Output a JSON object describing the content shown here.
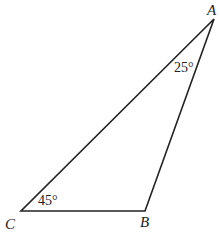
{
  "figure": {
    "type": "triangle",
    "vertices": [
      {
        "label": "A",
        "x": 214,
        "y": 19
      },
      {
        "label": "B",
        "x": 145,
        "y": 211
      },
      {
        "label": "C",
        "x": 21,
        "y": 211
      }
    ],
    "angles": [
      {
        "vertex": "A",
        "label": "25°"
      },
      {
        "vertex": "C",
        "label": "45°"
      }
    ],
    "stroke_color": "#222222"
  }
}
